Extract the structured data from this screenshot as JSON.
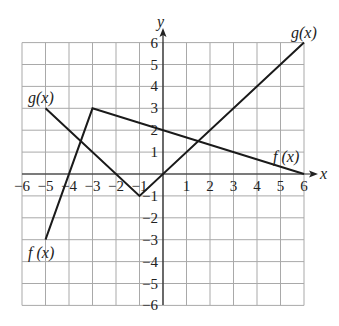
{
  "chart_data": {
    "type": "line",
    "title": "",
    "xlabel": "x",
    "ylabel": "y",
    "xlim": [
      -6,
      6
    ],
    "ylim": [
      -6,
      6
    ],
    "grid": true,
    "x_ticks": [
      -6,
      -5,
      -4,
      -3,
      -2,
      -1,
      1,
      2,
      3,
      4,
      5,
      6
    ],
    "y_ticks": [
      6,
      5,
      4,
      3,
      2,
      1,
      -1,
      -2,
      -3,
      -4,
      -5,
      -6
    ],
    "series": [
      {
        "name": "f(x)",
        "points": [
          [
            -5,
            -3
          ],
          [
            -3,
            3
          ],
          [
            6,
            0
          ]
        ],
        "labels": [
          {
            "text": "f (x)",
            "at": [
              -5,
              -3
            ],
            "position": "below"
          },
          {
            "text": "f (x)",
            "at": [
              6,
              0
            ],
            "position": "above-left"
          }
        ]
      },
      {
        "name": "g(x)",
        "points": [
          [
            -5,
            3
          ],
          [
            -1,
            -1
          ],
          [
            6,
            6
          ]
        ],
        "labels": [
          {
            "text": "g(x)",
            "at": [
              -5,
              3
            ],
            "position": "above"
          },
          {
            "text": "g(x)",
            "at": [
              6,
              6
            ],
            "position": "above"
          }
        ]
      }
    ]
  },
  "labels": {
    "x_axis": "x",
    "y_axis": "y",
    "g_left": "g(x)",
    "g_right": "g(x)",
    "f_left": "f (x)",
    "f_right": "f (x)"
  },
  "ticks": {
    "x": [
      "−6",
      "−5",
      "−4",
      "−3",
      "−2",
      "−1",
      "1",
      "2",
      "3",
      "4",
      "5",
      "6"
    ],
    "y": [
      "6",
      "5",
      "4",
      "3",
      "2",
      "1",
      "−1",
      "−2",
      "−3",
      "−4",
      "−5",
      "−6"
    ]
  }
}
